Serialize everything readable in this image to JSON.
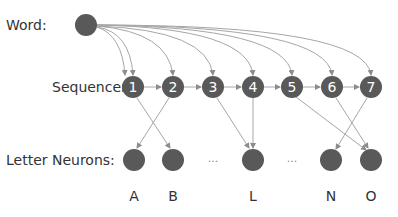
{
  "labels": {
    "word": "Word:",
    "sequencer": "Sequencer:",
    "letter_neurons": "Letter Neurons:"
  },
  "colors": {
    "node": "#595959",
    "edge": "#a6a6a6",
    "text": "#333333"
  },
  "word_node": {
    "x": 86,
    "y": 25
  },
  "sequencer": [
    {
      "label": "1",
      "x": 133
    },
    {
      "label": "2",
      "x": 173
    },
    {
      "label": "3",
      "x": 213
    },
    {
      "label": "4",
      "x": 253
    },
    {
      "label": "5",
      "x": 292
    },
    {
      "label": "6",
      "x": 332
    },
    {
      "label": "7",
      "x": 371
    }
  ],
  "letters": [
    {
      "label": "A",
      "x": 134
    },
    {
      "label": "B",
      "x": 173
    },
    {
      "label": "L",
      "x": 253
    },
    {
      "label": "N",
      "x": 331
    },
    {
      "label": "O",
      "x": 371
    }
  ],
  "ellipses": [
    "...",
    "..."
  ],
  "sequencer_to_letter": [
    {
      "from": "1",
      "to": "B"
    },
    {
      "from": "2",
      "to": "A"
    },
    {
      "from": "3",
      "to": "L"
    },
    {
      "from": "4",
      "to": "L"
    },
    {
      "from": "5",
      "to": "O"
    },
    {
      "from": "6",
      "to": "O"
    },
    {
      "from": "7",
      "to": "N"
    }
  ]
}
